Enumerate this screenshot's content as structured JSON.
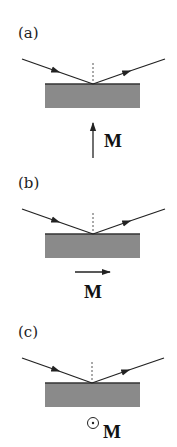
{
  "figure": {
    "colors": {
      "slab": "#8a8a8a",
      "slab_edge": "#333333",
      "ray": "#222222",
      "normal": "#555555"
    },
    "panels": [
      {
        "label": "(a)",
        "magnetization_label": "M",
        "magnetization_direction": "up (polar)"
      },
      {
        "label": "(b)",
        "magnetization_label": "M",
        "magnetization_direction": "right (longitudinal)"
      },
      {
        "label": "(c)",
        "magnetization_label": "M",
        "magnetization_direction": "out of plane (transverse)"
      }
    ]
  }
}
